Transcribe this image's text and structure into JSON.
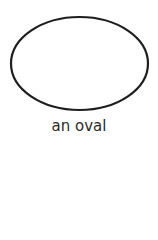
{
  "figure": {
    "shape": "oval-icon",
    "caption": "an oval",
    "stroke_color": "#1e1e1e",
    "caption_color": "#2b2b2b"
  }
}
